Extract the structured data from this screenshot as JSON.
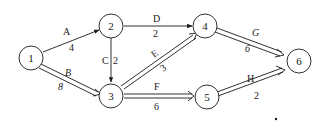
{
  "diagram": {
    "type": "network-activity-graph",
    "colors": {
      "stroke": "#1a1a1a",
      "background": "#ffffff"
    },
    "nodes": [
      {
        "id": "1",
        "label": "1",
        "x": 31,
        "y": 58
      },
      {
        "id": "2",
        "label": "2",
        "x": 112,
        "y": 26
      },
      {
        "id": "3",
        "label": "3",
        "x": 112,
        "y": 96
      },
      {
        "id": "4",
        "label": "4",
        "x": 205,
        "y": 26
      },
      {
        "id": "5",
        "label": "5",
        "x": 205,
        "y": 96
      },
      {
        "id": "6",
        "label": "6",
        "x": 294,
        "y": 60
      }
    ],
    "edges": [
      {
        "from": "1",
        "to": "2",
        "activity": "A",
        "duration": "4",
        "critical": false
      },
      {
        "from": "1",
        "to": "3",
        "activity": "B",
        "duration": "8",
        "critical": true
      },
      {
        "from": "2",
        "to": "3",
        "activity": "C",
        "duration": "2",
        "critical": false
      },
      {
        "from": "2",
        "to": "4",
        "activity": "D",
        "duration": "2",
        "critical": false
      },
      {
        "from": "3",
        "to": "4",
        "activity": "E",
        "duration": "3",
        "critical": true
      },
      {
        "from": "3",
        "to": "5",
        "activity": "F",
        "duration": "6",
        "critical": true
      },
      {
        "from": "4",
        "to": "6",
        "activity": "G",
        "duration": "6",
        "critical": true
      },
      {
        "from": "5",
        "to": "6",
        "activity": "H",
        "duration": "2",
        "critical": true
      }
    ]
  }
}
